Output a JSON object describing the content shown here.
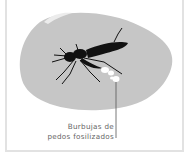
{
  "illustration": {
    "subject": "mosquito-in-amber",
    "stone_color": "#c6c6c6",
    "insect_color": "#111111",
    "bubble_color": "#ffffff"
  },
  "annotation": {
    "line1": "Burbujas de",
    "line2": "pedos fosilizados"
  }
}
